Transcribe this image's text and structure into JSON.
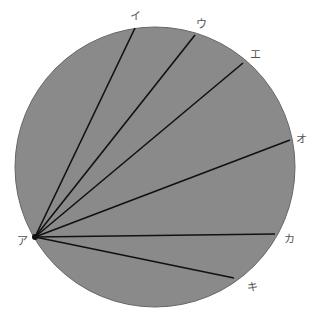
{
  "diagram": {
    "type": "circle-chords",
    "circle": {
      "cx": 155,
      "cy": 167,
      "r": 140,
      "fill": "#8a8a8a",
      "stroke": "#666666"
    },
    "origin": {
      "label": "ア",
      "x": 35,
      "y": 237,
      "label_x": 17,
      "label_y": 245
    },
    "chords": [
      {
        "label": "イ",
        "x": 135,
        "y": 28,
        "label_x": 130,
        "label_y": 20
      },
      {
        "label": "ウ",
        "x": 195,
        "y": 35,
        "label_x": 196,
        "label_y": 28
      },
      {
        "label": "エ",
        "x": 243,
        "y": 63,
        "label_x": 250,
        "label_y": 58
      },
      {
        "label": "オ",
        "x": 290,
        "y": 140,
        "label_x": 296,
        "label_y": 143
      },
      {
        "label": "カ",
        "x": 275,
        "y": 234,
        "label_x": 284,
        "label_y": 243
      },
      {
        "label": "キ",
        "x": 234,
        "y": 278,
        "label_x": 247,
        "label_y": 291
      }
    ],
    "line_color": "#111111"
  }
}
